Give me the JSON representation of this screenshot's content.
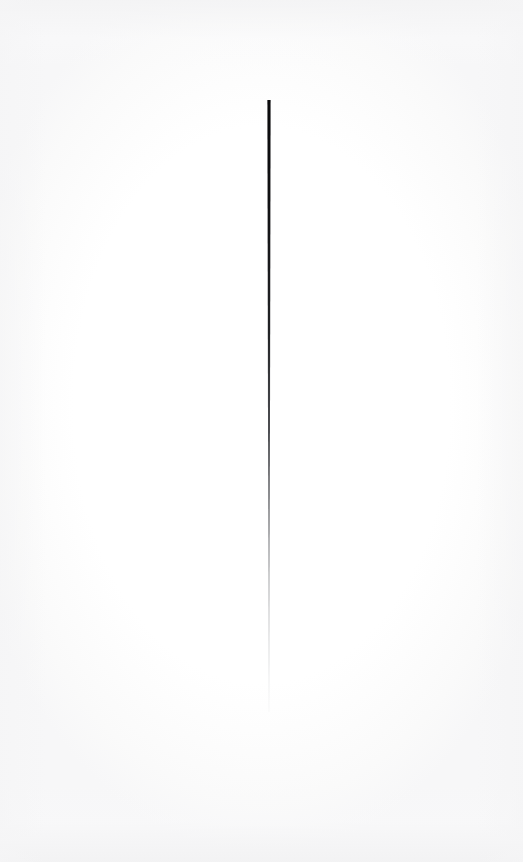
{
  "canvas": {
    "width": 523,
    "height": 862,
    "background_color": "#fefefe",
    "paper_tone_color": "#f4f4f5",
    "title": "Vertical Stroke Study"
  },
  "artwork": {
    "type": "single-stroke-drawing",
    "description": "A single thin near-vertical line on white paper, dense black at the top and fading to pale gray toward the lower tip.",
    "stroke": {
      "name": "vertical-line",
      "top_x": 269,
      "top_y": 100,
      "bottom_x": 269,
      "bottom_y": 712,
      "length_px": 612,
      "top_width_px": 3.2,
      "bottom_width_px": 0.9,
      "top_color": "#0a0a0c",
      "mid_color": "#55565a",
      "bottom_color": "#cfd0d2",
      "tip_shape": "blunt-flat",
      "orientation": "vertical"
    },
    "gradient_stops": [
      {
        "offset": "0%",
        "color": "#0b0b0d",
        "opacity": 1.0
      },
      {
        "offset": "16%",
        "color": "#101012",
        "opacity": 1.0
      },
      {
        "offset": "38%",
        "color": "#1b1c1f",
        "opacity": 0.97
      },
      {
        "offset": "55%",
        "color": "#3d3e42",
        "opacity": 0.9
      },
      {
        "offset": "68%",
        "color": "#6a6b6f",
        "opacity": 0.78
      },
      {
        "offset": "80%",
        "color": "#999a9d",
        "opacity": 0.6
      },
      {
        "offset": "91%",
        "color": "#bcbdc0",
        "opacity": 0.42
      },
      {
        "offset": "100%",
        "color": "#dcdddf",
        "opacity": 0.22
      }
    ]
  },
  "ghost_marks": {
    "top": {
      "text": "....  .  ....  .",
      "x": 198,
      "y": 72,
      "legible": false,
      "color": "#fdfdfe"
    },
    "bottom": {
      "text": ". .......  ..",
      "x": 196,
      "y": 733,
      "legible": false,
      "color": "#fcfcfd"
    }
  }
}
